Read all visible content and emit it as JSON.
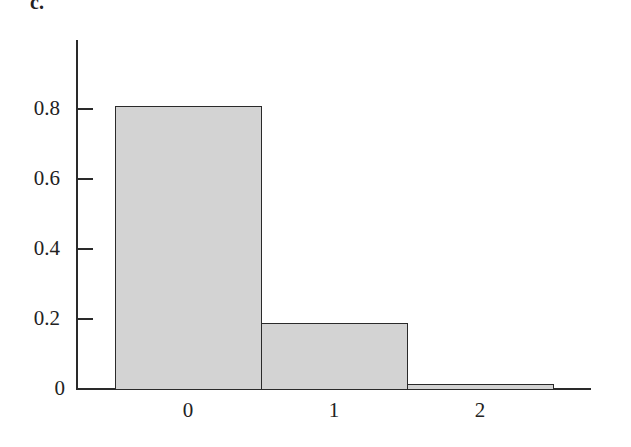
{
  "panel": {
    "label": "c."
  },
  "chart_data": {
    "type": "bar",
    "title": "",
    "xlabel": "",
    "ylabel": "",
    "categories": [
      "0",
      "1",
      "2"
    ],
    "values": [
      0.81,
      0.19,
      0.015
    ],
    "ylim": [
      0,
      1.0
    ],
    "yticks": [
      0,
      0.2,
      0.4,
      0.6,
      0.8
    ],
    "ytick_labels": [
      "0",
      "0.2",
      "0.4",
      "0.6",
      "0.8"
    ],
    "grid": false,
    "legend": null,
    "bar_color": "#d3d3d3",
    "edge_color": "#2a2a2a"
  }
}
